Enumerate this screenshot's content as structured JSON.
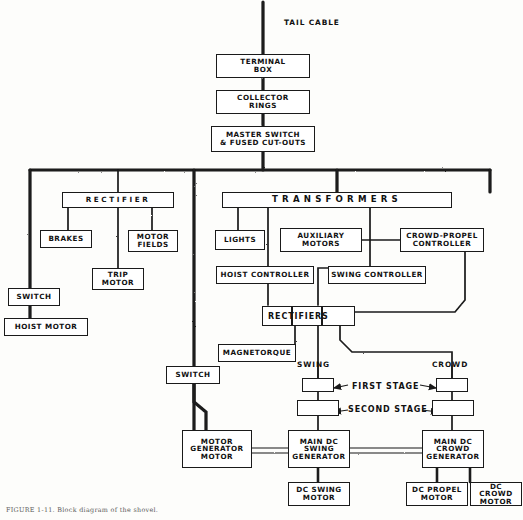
{
  "figure": {
    "caption": "FIGURE 1-11. Block diagram of the shovel.",
    "background_color": "#fdfdfb",
    "line_color": "#1a1a1a"
  },
  "labels": {
    "tail_cable": "TAIL CABLE",
    "swing": "SWING",
    "crowd": "CROWD",
    "first_stage": "FIRST STAGE",
    "second_stage": "SECOND STAGE"
  },
  "blocks": {
    "terminal_box": "TERMINAL\nBOX",
    "collector_rings": "COLLECTOR\nRINGS",
    "master_switch": "MASTER SWITCH\n& FUSED CUT-OUTS",
    "rectifier": "RECTIFIER",
    "brakes": "BRAKES",
    "motor_fields": "MOTOR\nFIELDS",
    "trip_motor": "TRIP\nMOTOR",
    "switch_left": "SWITCH",
    "hoist_motor": "HOIST MOTOR",
    "transformers": "TRANSFORMERS",
    "lights": "LIGHTS",
    "auxiliary_motors": "AUXILIARY\nMOTORS",
    "crowd_propel_controller": "CROWD-PROPEL\nCONTROLLER",
    "hoist_controller": "HOIST CONTROLLER",
    "swing_controller": "SWING CONTROLLER",
    "rectifiers": "RECTIFIERS",
    "magnetorque": "MAGNETORQUE",
    "switch_lower": "SWITCH",
    "motor_generator_motor": "MOTOR\nGENERATOR\nMOTOR",
    "main_dc_swing_generator": "MAIN DC\nSWING\nGENERATOR",
    "main_dc_crowd_generator": "MAIN DC\nCROWD\nGENERATOR",
    "dc_swing_motor": "DC SWING\nMOTOR",
    "dc_propel_motor": "DC PROPEL\nMOTOR",
    "dc_crowd_motor": "DC CROWD\nMOTOR",
    "swing_first_stage": "",
    "swing_second_stage": "",
    "crowd_first_stage": "",
    "crowd_second_stage": ""
  }
}
